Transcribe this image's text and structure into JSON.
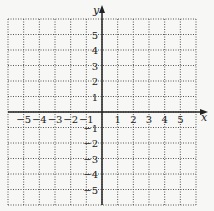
{
  "chart_data": {
    "type": "grid",
    "title": "",
    "xlabel": "x",
    "ylabel": "y",
    "xlim": [
      -6,
      6
    ],
    "ylim": [
      -6,
      6
    ],
    "grid": true,
    "grid_style": "dotted",
    "x_tick_labels": [
      "−5",
      "−4",
      "−3",
      "−2",
      "−1",
      "1",
      "2",
      "3",
      "4",
      "5"
    ],
    "x_tick_values": [
      -5,
      -4,
      -3,
      -2,
      -1,
      1,
      2,
      3,
      4,
      5
    ],
    "y_tick_labels": [
      "5",
      "4",
      "3",
      "2",
      "1",
      "−1",
      "−2",
      "−3",
      "−4",
      "−5"
    ],
    "y_tick_values": [
      5,
      4,
      3,
      2,
      1,
      -1,
      -2,
      -3,
      -4,
      -5
    ],
    "series": []
  },
  "colors": {
    "background": "#f7f7f5",
    "grid": "#555555",
    "axis": "#222222"
  }
}
